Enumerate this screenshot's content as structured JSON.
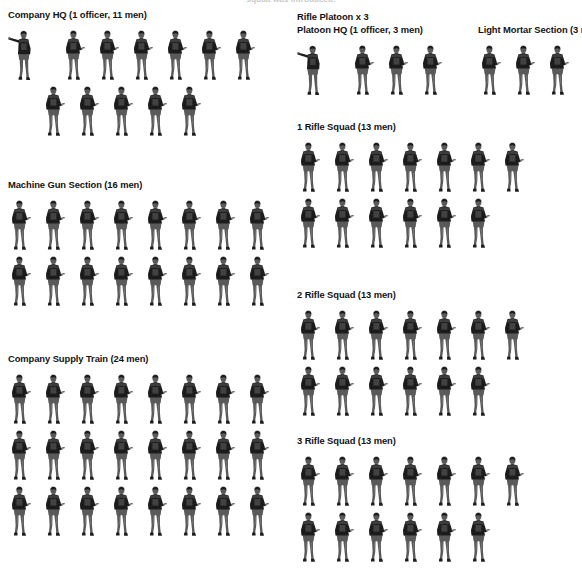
{
  "document": {
    "top_caption": "squad was introduced.",
    "title": "Infantry Company Organization"
  },
  "soldier_icon": {
    "rifleman": "rifleman-figure-icon",
    "officer": "officer-pointing-figure-icon"
  },
  "colors": {
    "text": "#131313",
    "figure_dark": "#1c1c1c",
    "figure_mid": "#5a5a5a",
    "figure_light": "#9a9a9a",
    "background": "#ffffff"
  },
  "left_column": {
    "units": [
      {
        "id": "company-hq",
        "title": "Company HQ (1 officer, 11 men)",
        "officers": 1,
        "men": 11,
        "rows": [
          {
            "officer": true,
            "riflemen": 6
          },
          {
            "officer": false,
            "riflemen": 5,
            "indent": 1
          }
        ]
      },
      {
        "id": "machine-gun-section",
        "title": "Machine Gun Section (16 men)",
        "officers": 0,
        "men": 16,
        "rows": [
          {
            "officer": false,
            "riflemen": 8
          },
          {
            "officer": false,
            "riflemen": 8
          }
        ]
      },
      {
        "id": "company-supply-train",
        "title": "Company Supply Train (24 men)",
        "officers": 0,
        "men": 24,
        "rows": [
          {
            "officer": false,
            "riflemen": 8
          },
          {
            "officer": false,
            "riflemen": 8
          },
          {
            "officer": false,
            "riflemen": 8
          }
        ]
      }
    ]
  },
  "right_column": {
    "platoon_header": "Rifle Platoon x 3",
    "units": [
      {
        "id": "platoon-hq",
        "title": "Platoon HQ (1 officer, 3 men)",
        "officers": 1,
        "men": 3,
        "rows": [
          {
            "officer": true,
            "riflemen": 3
          }
        ]
      },
      {
        "id": "light-mortar-section",
        "title": "Light Mortar Section (3 men)",
        "officers": 0,
        "men": 3,
        "rows": [
          {
            "officer": false,
            "riflemen": 3
          }
        ]
      },
      {
        "id": "rifle-squad-1",
        "title": "1 Rifle Squad (13 men)",
        "officers": 0,
        "men": 13,
        "rows": [
          {
            "officer": false,
            "riflemen": 7
          },
          {
            "officer": false,
            "riflemen": 6
          }
        ]
      },
      {
        "id": "rifle-squad-2",
        "title": "2 Rifle Squad (13 men)",
        "officers": 0,
        "men": 13,
        "rows": [
          {
            "officer": false,
            "riflemen": 7
          },
          {
            "officer": false,
            "riflemen": 6
          }
        ]
      },
      {
        "id": "rifle-squad-3",
        "title": "3 Rifle Squad (13 men)",
        "officers": 0,
        "men": 13,
        "rows": [
          {
            "officer": false,
            "riflemen": 7
          },
          {
            "officer": false,
            "riflemen": 6
          }
        ]
      }
    ]
  }
}
